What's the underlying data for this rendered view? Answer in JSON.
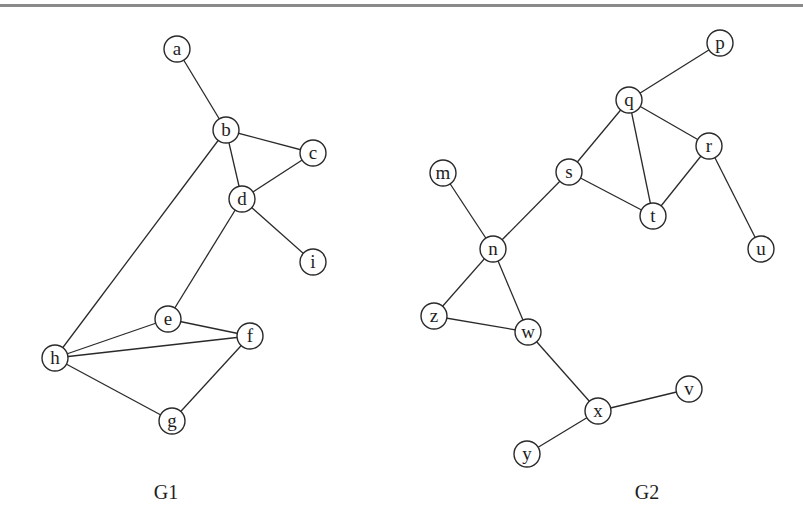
{
  "graphs": [
    {
      "id": "G1",
      "title": "G1",
      "title_pos": [
        166,
        499
      ],
      "nodes": [
        {
          "id": "a",
          "label": "a",
          "x": 177,
          "y": 49
        },
        {
          "id": "b",
          "label": "b",
          "x": 226,
          "y": 130
        },
        {
          "id": "c",
          "label": "c",
          "x": 313,
          "y": 153
        },
        {
          "id": "d",
          "label": "d",
          "x": 242,
          "y": 199
        },
        {
          "id": "i",
          "label": "i",
          "x": 313,
          "y": 262
        },
        {
          "id": "e",
          "label": "e",
          "x": 168,
          "y": 319
        },
        {
          "id": "f",
          "label": "f",
          "x": 250,
          "y": 336
        },
        {
          "id": "h",
          "label": "h",
          "x": 55,
          "y": 358
        },
        {
          "id": "g",
          "label": "g",
          "x": 172,
          "y": 421
        }
      ],
      "edges": [
        [
          "a",
          "b"
        ],
        [
          "b",
          "c"
        ],
        [
          "b",
          "d"
        ],
        [
          "c",
          "d"
        ],
        [
          "d",
          "i"
        ],
        [
          "d",
          "e"
        ],
        [
          "b",
          "h"
        ],
        [
          "e",
          "h"
        ],
        [
          "e",
          "f"
        ],
        [
          "h",
          "f"
        ],
        [
          "h",
          "g"
        ],
        [
          "g",
          "f"
        ]
      ]
    },
    {
      "id": "G2",
      "title": "G2",
      "title_pos": [
        647,
        499
      ],
      "nodes": [
        {
          "id": "p",
          "label": "p",
          "x": 720,
          "y": 43
        },
        {
          "id": "q",
          "label": "q",
          "x": 629,
          "y": 100
        },
        {
          "id": "r",
          "label": "r",
          "x": 709,
          "y": 146
        },
        {
          "id": "m",
          "label": "m",
          "x": 443,
          "y": 173
        },
        {
          "id": "s",
          "label": "s",
          "x": 569,
          "y": 172
        },
        {
          "id": "t",
          "label": "t",
          "x": 653,
          "y": 216
        },
        {
          "id": "n",
          "label": "n",
          "x": 493,
          "y": 249
        },
        {
          "id": "u",
          "label": "u",
          "x": 761,
          "y": 249
        },
        {
          "id": "z",
          "label": "z",
          "x": 434,
          "y": 316
        },
        {
          "id": "w",
          "label": "w",
          "x": 528,
          "y": 332
        },
        {
          "id": "x",
          "label": "x",
          "x": 598,
          "y": 411
        },
        {
          "id": "v",
          "label": "v",
          "x": 689,
          "y": 389
        },
        {
          "id": "y",
          "label": "y",
          "x": 527,
          "y": 454
        }
      ],
      "edges": [
        [
          "p",
          "q"
        ],
        [
          "q",
          "s"
        ],
        [
          "q",
          "t"
        ],
        [
          "q",
          "r"
        ],
        [
          "s",
          "t"
        ],
        [
          "r",
          "t"
        ],
        [
          "r",
          "u"
        ],
        [
          "s",
          "n"
        ],
        [
          "m",
          "n"
        ],
        [
          "n",
          "z"
        ],
        [
          "n",
          "w"
        ],
        [
          "z",
          "w"
        ],
        [
          "w",
          "x"
        ],
        [
          "x",
          "v"
        ],
        [
          "x",
          "y"
        ]
      ]
    }
  ],
  "style": {
    "node_radius": 13,
    "stroke_color": "#2a2a2a",
    "background": "#ffffff"
  }
}
